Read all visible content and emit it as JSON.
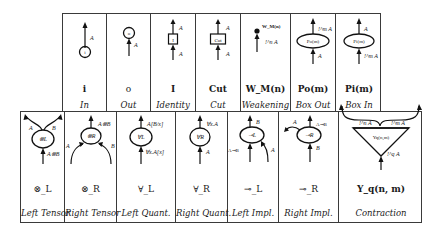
{
  "top_row": [
    {
      "symbol": "i",
      "name": "In",
      "node": "i",
      "labels": [
        "A"
      ]
    },
    {
      "symbol": "o",
      "name": "Out",
      "node": "o",
      "labels": [
        "A"
      ]
    },
    {
      "symbol": "I",
      "name": "Identity",
      "node": "I",
      "labels": [
        "A",
        "A"
      ]
    },
    {
      "symbol": "Cut",
      "name": "Cut",
      "node": "Cut",
      "labels": [
        "A",
        "A"
      ]
    },
    {
      "symbol": "W_M(n)",
      "name": "Weakening",
      "node": "W_M(n)",
      "labels": [
        "W_M(n)",
        "!^n A"
      ]
    },
    {
      "symbol": "Po(m)",
      "name": "Box Out",
      "node": "Po(m)",
      "labels": [
        "!^m A",
        "A"
      ]
    },
    {
      "symbol": "Pi(m)",
      "name": "Box In",
      "node": "Pi(m)",
      "labels": [
        "A",
        "!^m A"
      ]
    }
  ],
  "bottom_row": [
    {
      "symbol": "⊗_L",
      "name": "Left Tensor",
      "node": "⊗L",
      "labels": [
        "A",
        "B",
        "A⊗B"
      ]
    },
    {
      "symbol": "⊗_R",
      "name": "Right Tensor",
      "node": "⊗R",
      "labels": [
        "A⊗B",
        "A",
        "B"
      ]
    },
    {
      "symbol": "∀_L",
      "name": "Left Quant.",
      "node": "∀L",
      "labels": [
        "A[B/x]",
        "∀x.A[x]"
      ]
    },
    {
      "symbol": "∀_R",
      "name": "Right Quant.",
      "node": "∀R",
      "labels": [
        "∀x.A",
        "A"
      ]
    },
    {
      "symbol": "⊸_L",
      "name": "Left Impl.",
      "node": "⊸L",
      "labels": [
        "B",
        "A⊸B",
        "A"
      ]
    },
    {
      "symbol": "⊸_R",
      "name": "Right Impl.",
      "node": "⊸R",
      "labels": [
        "A",
        "A⊸B",
        "B"
      ]
    },
    {
      "symbol": "Y_q(n, m)",
      "name": "Contraction",
      "node": "Yq(n,m)",
      "labels": [
        "!^n A",
        "!^m A",
        "!^q A"
      ]
    }
  ]
}
